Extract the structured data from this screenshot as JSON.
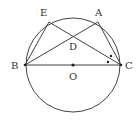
{
  "figure": {
    "type": "geometry-circle-inscribed",
    "colors": {
      "stroke": "#444444",
      "text": "#333333",
      "background": "#ffffff"
    },
    "points": {
      "A": {
        "label": "A"
      },
      "B": {
        "label": "B"
      },
      "C": {
        "label": "C"
      },
      "D": {
        "label": "D"
      },
      "E": {
        "label": "E"
      },
      "O": {
        "label": "O"
      }
    },
    "segments": [
      "BC",
      "BE",
      "BA",
      "EC",
      "AC"
    ],
    "circle": {
      "center": "O",
      "through": [
        "A",
        "B",
        "C",
        "E"
      ]
    },
    "angle_marks": [
      {
        "vertex": "C",
        "between": [
          "A",
          "E"
        ],
        "mark": "dot"
      },
      {
        "vertex": "C",
        "between": [
          "E",
          "B"
        ],
        "mark": "dot"
      }
    ]
  }
}
